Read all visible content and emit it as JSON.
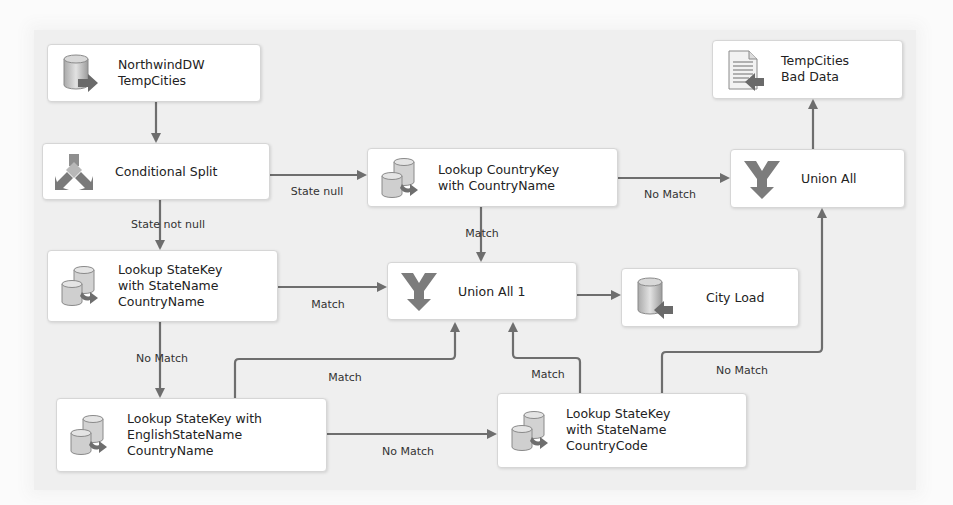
{
  "diagram": {
    "type": "SSIS data flow",
    "colors": {
      "canvas": "#efefef",
      "node_fill": "#ffffff",
      "node_border": "#d6d6d6",
      "connector": "#6e6e6e",
      "text": "#222222"
    },
    "nodes": {
      "source": {
        "label": "NorthwindDW\nTempCities",
        "icon": "database-source-icon"
      },
      "split": {
        "label": "Conditional Split",
        "icon": "conditional-split-icon"
      },
      "lookup_country": {
        "label": "Lookup CountryKey\nwith CountryName",
        "icon": "lookup-icon"
      },
      "union_all": {
        "label": "Union All",
        "icon": "union-all-icon"
      },
      "bad_data": {
        "label": "TempCities\nBad Data",
        "icon": "flat-file-destination-icon"
      },
      "lookup_state": {
        "label": "Lookup StateKey\nwith StateName\nCountryName",
        "icon": "lookup-icon"
      },
      "union_all_1": {
        "label": "Union All 1",
        "icon": "union-all-icon"
      },
      "city_load": {
        "label": "City Load",
        "icon": "database-destination-icon"
      },
      "lookup_english": {
        "label": "Lookup StateKey with\nEnglishStateName\nCountryName",
        "icon": "lookup-icon"
      },
      "lookup_code": {
        "label": "Lookup StateKey\nwith StateName\nCountryCode",
        "icon": "lookup-icon"
      }
    },
    "edges": {
      "source_to_split": {
        "label": ""
      },
      "split_state_null": {
        "label": "State null"
      },
      "split_state_not_null": {
        "label": "State not null"
      },
      "country_no_match": {
        "label": "No Match"
      },
      "country_match": {
        "label": "Match"
      },
      "union_to_bad": {
        "label": ""
      },
      "state_match": {
        "label": "Match"
      },
      "state_no_match": {
        "label": "No Match"
      },
      "union1_to_city": {
        "label": ""
      },
      "english_match": {
        "label": "Match"
      },
      "english_no_match": {
        "label": "No Match"
      },
      "code_match": {
        "label": "Match"
      },
      "code_no_match": {
        "label": "No Match"
      }
    }
  }
}
